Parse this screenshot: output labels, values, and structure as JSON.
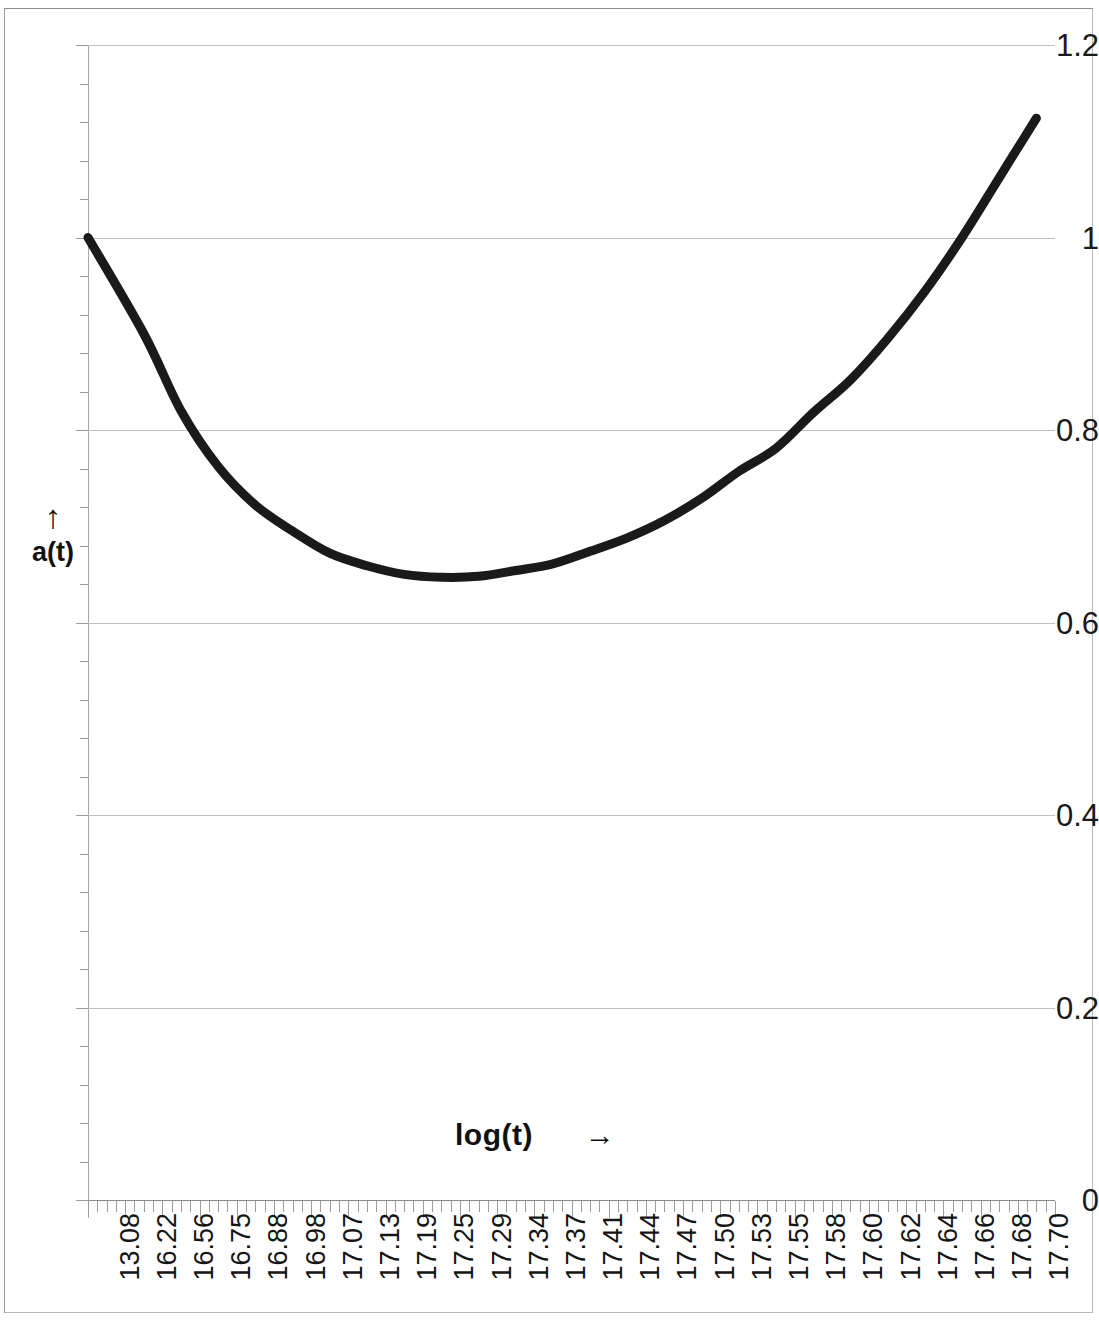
{
  "chart_data": {
    "type": "line",
    "title": "",
    "subtitle": "",
    "xlabel": "log(t)",
    "xlabel_arrow": "→",
    "ylabel": "a(t)",
    "ylabel_arrow": "↑",
    "grid": true,
    "legend": null,
    "line_color": "#1a1a1a",
    "grid_color": "#bfbfbf",
    "xlim": [
      0,
      25
    ],
    "ylim": [
      0,
      1.2
    ],
    "y_ticks": [
      "1.2",
      "1",
      "0.8",
      "0.6",
      "0.4",
      "0.2",
      "0"
    ],
    "y_tick_values": [
      1.2,
      1.0,
      0.8,
      0.6,
      0.4,
      0.2,
      0
    ],
    "y_minor_ticks_between": 4,
    "x_tick_labels": [
      "13.08",
      "16.22",
      "16.56",
      "16.75",
      "16.88",
      "16.98",
      "17.07",
      "17.13",
      "17.19",
      "17.25",
      "17.29",
      "17.34",
      "17.37",
      "17.41",
      "17.44",
      "17.47",
      "17.50",
      "17.53",
      "17.55",
      "17.58",
      "17.60",
      "17.62",
      "17.64",
      "17.66",
      "17.68",
      "17.70"
    ],
    "x": [
      13.08,
      16.22,
      16.56,
      16.75,
      16.88,
      16.98,
      17.07,
      17.13,
      17.19,
      17.25,
      17.29,
      17.34,
      17.37,
      17.41,
      17.44,
      17.47,
      17.5,
      17.53,
      17.55,
      17.58,
      17.6,
      17.62,
      17.64,
      17.66,
      17.68,
      17.7
    ],
    "values": [
      1.0,
      0.9,
      0.82,
      0.762,
      0.722,
      0.695,
      0.672,
      0.659,
      0.65,
      0.647,
      0.648,
      0.654,
      0.661,
      0.674,
      0.688,
      0.706,
      0.729,
      0.757,
      0.781,
      0.818,
      0.852,
      0.895,
      0.944,
      1.0,
      1.062,
      1.124
    ],
    "series": [
      {
        "name": "a(t)",
        "values": [
          1.0,
          0.9,
          0.82,
          0.762,
          0.722,
          0.695,
          0.672,
          0.659,
          0.65,
          0.647,
          0.648,
          0.654,
          0.661,
          0.674,
          0.688,
          0.706,
          0.729,
          0.757,
          0.781,
          0.818,
          0.852,
          0.895,
          0.944,
          1.0,
          1.062,
          1.124
        ]
      }
    ],
    "notes": {
      "start_value": 1.0,
      "minimum_value": 0.647,
      "minimum_at_label": "17.25",
      "end_value": 1.124
    }
  }
}
